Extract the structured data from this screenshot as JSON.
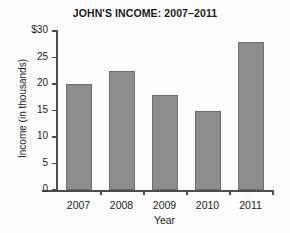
{
  "chart_data": {
    "type": "bar",
    "title": "JOHN'S INCOME: 2007–2011",
    "xlabel": "Year",
    "ylabel": "Income  (in thousands)",
    "categories": [
      "2007",
      "2008",
      "2009",
      "2010",
      "2011"
    ],
    "values": [
      20,
      22.5,
      18,
      15,
      28
    ],
    "ylim": [
      0,
      30
    ],
    "ytick_values": [
      0,
      5,
      10,
      15,
      20,
      25,
      30
    ],
    "ytick_labels": [
      "0",
      "5",
      "10",
      "15",
      "20",
      "25",
      "$30"
    ],
    "grid": false,
    "legend": null,
    "bar_color": "#8d8d8d",
    "bar_border_color": "#6e6e6e",
    "axis_color": "#4d4d4d",
    "background": "#fdfdfd"
  }
}
